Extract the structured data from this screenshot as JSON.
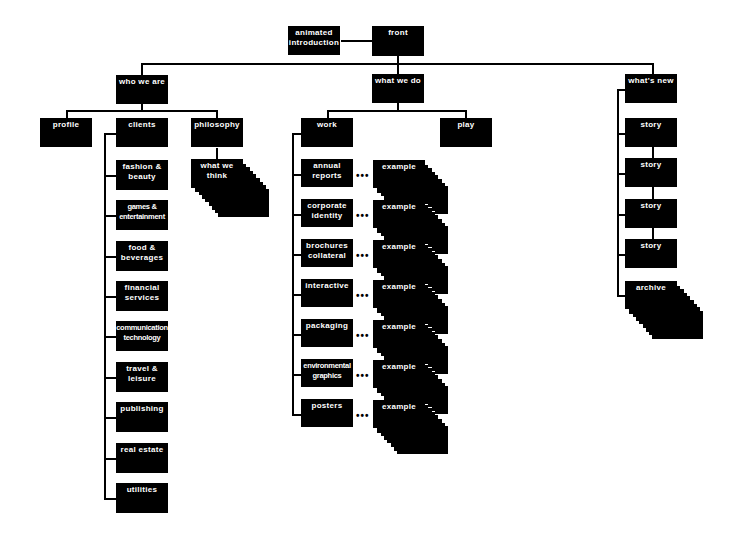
{
  "diagram": {
    "root": {
      "label": "front",
      "x": 372,
      "y": 26,
      "h": 30
    },
    "intro": {
      "label": "animated introduction",
      "lines": [
        "animated",
        "introduction"
      ],
      "x": 288,
      "y": 26
    },
    "sections": [
      {
        "label": "who we are",
        "x": 116,
        "y": 75
      },
      {
        "label": "what we do",
        "x": 372,
        "y": 74
      },
      {
        "label": "what's new",
        "x": 625,
        "y": 74
      }
    ],
    "who_we_are": {
      "children": [
        {
          "label": "profile",
          "x": 40,
          "y": 118
        },
        {
          "label": "clients",
          "x": 116,
          "y": 118
        },
        {
          "label": "philosophy",
          "x": 191,
          "y": 118
        }
      ],
      "philosophy_child": {
        "lines": [
          "what we",
          "think"
        ],
        "x": 191,
        "y": 159,
        "stacked": true
      },
      "clients": [
        {
          "lines": [
            "fashion &",
            "beauty"
          ],
          "y": 160
        },
        {
          "lines": [
            "games &",
            "entertainment"
          ],
          "y": 200,
          "tight": true
        },
        {
          "lines": [
            "food &",
            "beverages"
          ],
          "y": 241
        },
        {
          "lines": [
            "financial",
            "services"
          ],
          "y": 281
        },
        {
          "lines": [
            "communication",
            "technology"
          ],
          "y": 321,
          "tight": true
        },
        {
          "lines": [
            "travel &",
            "leisure"
          ],
          "y": 362
        },
        {
          "lines": [
            "publishing"
          ],
          "y": 402
        },
        {
          "lines": [
            "real estate"
          ],
          "y": 443
        },
        {
          "lines": [
            "utilities"
          ],
          "y": 483
        }
      ]
    },
    "what_we_do": {
      "children": [
        {
          "label": "work",
          "x": 301,
          "y": 118
        },
        {
          "label": "play",
          "x": 440,
          "y": 118
        }
      ],
      "work_items": [
        {
          "lines": [
            "annual",
            "reports"
          ],
          "y": 159,
          "example": "example"
        },
        {
          "lines": [
            "corporate",
            "identity"
          ],
          "y": 199,
          "example": "example"
        },
        {
          "lines": [
            "brochures",
            "collateral"
          ],
          "y": 239,
          "example": "example"
        },
        {
          "lines": [
            "interactive"
          ],
          "y": 279,
          "example": "example"
        },
        {
          "lines": [
            "packaging"
          ],
          "y": 319,
          "example": "example"
        },
        {
          "lines": [
            "environmental",
            "graphics"
          ],
          "y": 359,
          "example": "example",
          "tight": true
        },
        {
          "lines": [
            "posters"
          ],
          "y": 399,
          "example": "example"
        }
      ],
      "ellipsis": "•••"
    },
    "whats_new": {
      "stories": [
        {
          "label": "story",
          "y": 118
        },
        {
          "label": "story",
          "y": 158
        },
        {
          "label": "story",
          "y": 199
        },
        {
          "label": "story",
          "y": 239
        }
      ],
      "archive": {
        "label": "archive",
        "y": 281,
        "stacked": true
      }
    },
    "colors": {
      "box": "#000000",
      "text": "#ffffff",
      "line": "#000000",
      "background": "#ffffff"
    }
  }
}
